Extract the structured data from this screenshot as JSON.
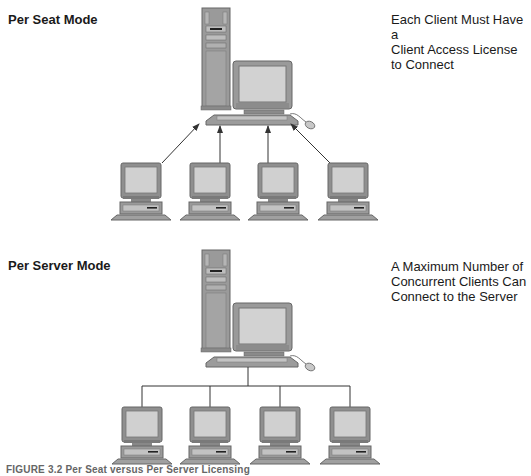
{
  "panels": [
    {
      "id": "per-seat",
      "heading": "Per Seat Mode",
      "description": "Each Client Must Have a Client Access License to Connect",
      "description_lines": [
        "Each Client Must Have a",
        "Client Access License",
        "to Connect"
      ],
      "connection_style": "arrows-to-server",
      "server": "server-workstation",
      "clients": [
        "client-1",
        "client-2",
        "client-3",
        "client-4"
      ]
    },
    {
      "id": "per-server",
      "heading": "Per Server Mode",
      "description": "A Maximum Number of Concurrent Clients Can Connect to the Server",
      "description_lines": [
        "A Maximum Number of",
        "Concurrent Clients Can",
        "Connect to the Server"
      ],
      "connection_style": "bus-lines",
      "server": "server-workstation",
      "clients": [
        "client-1",
        "client-2",
        "client-3",
        "client-4"
      ]
    }
  ],
  "caption": "FIGURE 3.2 Per Seat versus Per Server Licensing",
  "colors": {
    "device_body": "#8f8f8f",
    "device_dark": "#6e6e6e",
    "screen": "#cfcfcf",
    "line": "#333333"
  }
}
